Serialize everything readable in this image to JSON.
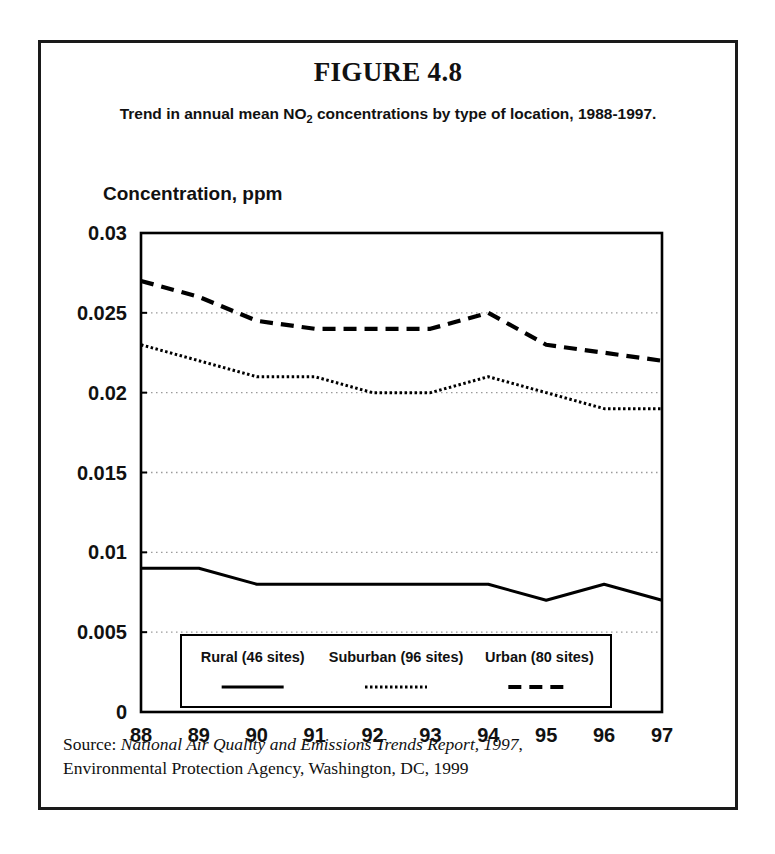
{
  "figure": {
    "title": "FIGURE 4.8",
    "subtitle_before": "Trend in annual mean NO",
    "subtitle_sub": "2",
    "subtitle_after": " concentrations by type of location, 1988-1997.",
    "axis_title": "Concentration, ppm",
    "source_label": "Source:",
    "source_italic": "National Air Quality and Emissions Trends Report, 1997",
    "source_rest": ",",
    "source_line2": "Environmental Protection Agency, Washington, DC, 1999",
    "border_color": "#1a1a1a",
    "line_color": "#000000",
    "grid_color": "#9a9a9a"
  },
  "chart_data": {
    "type": "line",
    "title": "Trend in annual mean NO2 concentrations by type of location, 1988-1997.",
    "xlabel": "",
    "ylabel": "Concentration, ppm",
    "categories": [
      "88",
      "89",
      "90",
      "91",
      "92",
      "93",
      "94",
      "95",
      "96",
      "97"
    ],
    "x": [
      1988,
      1989,
      1990,
      1991,
      1992,
      1993,
      1994,
      1995,
      1996,
      1997
    ],
    "ylim": [
      0,
      0.03
    ],
    "yticks": [
      0,
      0.005,
      0.01,
      0.015,
      0.02,
      0.025,
      0.03
    ],
    "ytick_labels": [
      "0",
      "0.005",
      "0.01",
      "0.015",
      "0.02",
      "0.025",
      "0.03"
    ],
    "grid": true,
    "grid_axis": "y",
    "legend_position": "inside-bottom-center",
    "series": [
      {
        "name": "Rural (46 sites)",
        "style": "solid",
        "values": [
          0.009,
          0.009,
          0.008,
          0.008,
          0.008,
          0.008,
          0.008,
          0.007,
          0.008,
          0.007
        ]
      },
      {
        "name": "Suburban (96 sites)",
        "style": "dotted",
        "values": [
          0.023,
          0.022,
          0.021,
          0.021,
          0.02,
          0.02,
          0.021,
          0.02,
          0.019,
          0.019
        ]
      },
      {
        "name": "Urban (80 sites)",
        "style": "dashed",
        "values": [
          0.027,
          0.026,
          0.0245,
          0.024,
          0.024,
          0.024,
          0.025,
          0.023,
          0.0225,
          0.022
        ]
      }
    ]
  }
}
